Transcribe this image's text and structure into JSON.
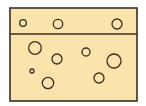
{
  "diagram": {
    "colors": {
      "fill": "#fbe3ac",
      "stroke": "#3a2e22",
      "background": "#ffffff"
    },
    "container": {
      "x": 10,
      "y": 8,
      "width": 127,
      "height": 93
    },
    "divider_y": 34,
    "top_layer_bubbles": [
      {
        "cx": 23,
        "cy": 23,
        "r": 3.3
      },
      {
        "cx": 58,
        "cy": 24,
        "r": 4.7
      },
      {
        "cx": 117,
        "cy": 24,
        "r": 5
      }
    ],
    "bottom_layer_bubbles": [
      {
        "cx": 35,
        "cy": 48,
        "r": 6.3
      },
      {
        "cx": 57,
        "cy": 59,
        "r": 5
      },
      {
        "cx": 86,
        "cy": 52,
        "r": 4
      },
      {
        "cx": 114,
        "cy": 61,
        "r": 7
      },
      {
        "cx": 32,
        "cy": 71,
        "r": 2
      },
      {
        "cx": 48,
        "cy": 83,
        "r": 5.7
      },
      {
        "cx": 99,
        "cy": 78,
        "r": 5
      }
    ]
  }
}
